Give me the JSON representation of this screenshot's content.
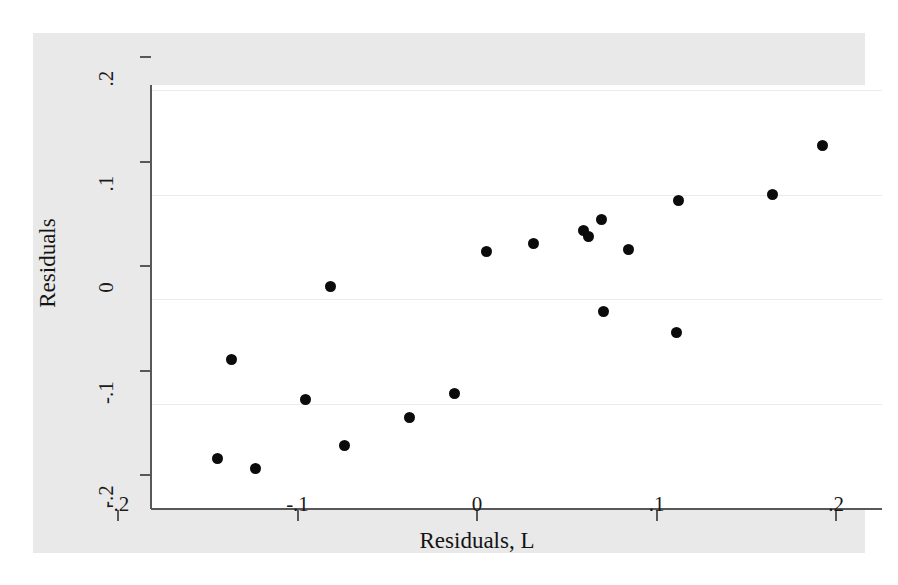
{
  "chart_data": {
    "type": "scatter",
    "title": "",
    "xlabel": "Residuals, L",
    "ylabel": "Residuals",
    "xlim": [
      -0.2,
      0.2
    ],
    "ylim": [
      -0.2,
      0.2
    ],
    "xticks": [
      -0.2,
      -0.1,
      0,
      0.1,
      0.2
    ],
    "yticks": [
      -0.2,
      -0.1,
      0,
      0.1,
      0.2
    ],
    "xticklabels": [
      "-.2",
      "-.1",
      "0",
      ".1",
      ".2"
    ],
    "yticklabels": [
      "-.2",
      "-.1",
      "0",
      ".1",
      ".2"
    ],
    "grid": "horizontal",
    "legend": "none",
    "marker": {
      "shape": "circle",
      "color": "#0b0b0b",
      "size_px": 11
    },
    "n_points": 21,
    "points": [
      {
        "x": -0.163,
        "y": -0.153
      },
      {
        "x": -0.155,
        "y": -0.058
      },
      {
        "x": -0.142,
        "y": -0.162
      },
      {
        "x": -0.114,
        "y": -0.096
      },
      {
        "x": -0.1,
        "y": 0.012
      },
      {
        "x": -0.092,
        "y": -0.14
      },
      {
        "x": -0.056,
        "y": -0.113
      },
      {
        "x": -0.031,
        "y": -0.09
      },
      {
        "x": -0.013,
        "y": 0.045
      },
      {
        "x": 0.013,
        "y": 0.053
      },
      {
        "x": 0.041,
        "y": 0.066
      },
      {
        "x": 0.044,
        "y": 0.06
      },
      {
        "x": 0.051,
        "y": 0.076
      },
      {
        "x": 0.052,
        "y": -0.012
      },
      {
        "x": 0.066,
        "y": 0.047
      },
      {
        "x": 0.094,
        "y": 0.094
      },
      {
        "x": 0.093,
        "y": -0.032
      },
      {
        "x": 0.146,
        "y": 0.1
      },
      {
        "x": 0.174,
        "y": 0.147
      }
    ]
  }
}
